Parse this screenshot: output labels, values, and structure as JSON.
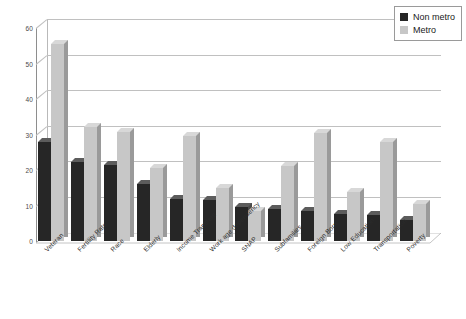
{
  "chart_data": {
    "type": "bar",
    "title": "",
    "subtitle": "",
    "xlabel": "",
    "ylabel": "",
    "ylim": [
      0,
      60
    ],
    "ytick_values": [
      0,
      10,
      20,
      30,
      40,
      50,
      60
    ],
    "ytick_labels": [
      "0",
      "10",
      "20",
      "30",
      "40",
      "50",
      "60"
    ],
    "grid": true,
    "legend_position": "top-right",
    "categories": [
      "Veteran",
      "Fertility Rate",
      "Race",
      "Elderly",
      "Income Transfers",
      "Work age dependency",
      "SNAP",
      "Subfamilies",
      "Foreign Born",
      "Low Education",
      "Transportation",
      "Poverty"
    ],
    "series": [
      {
        "name": "Non metro",
        "color": "#262626",
        "values": [
          28.0,
          22.2,
          21.5,
          16.0,
          11.8,
          11.6,
          9.5,
          9.0,
          8.5,
          7.5,
          7.4,
          5.8
        ]
      },
      {
        "name": "Metro",
        "color": "#c7c7c7",
        "values": [
          55.5,
          32.0,
          30.8,
          20.5,
          29.7,
          15.0,
          8.4,
          21.0,
          30.5,
          13.8,
          28.0,
          10.4
        ]
      }
    ]
  },
  "legend": {
    "items": [
      {
        "label": "Non metro",
        "color": "#262626"
      },
      {
        "label": "Metro",
        "color": "#c7c7c7"
      }
    ]
  }
}
